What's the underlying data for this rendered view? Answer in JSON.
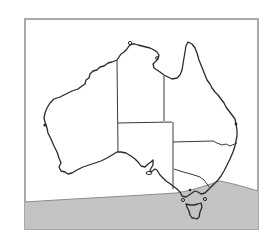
{
  "map": {
    "subject": "Australia",
    "style": "outline map with state borders",
    "frame": {
      "x": 25,
      "y": 19,
      "width": 233,
      "height": 210,
      "border_color": "#a8a8a8"
    },
    "colors": {
      "land_fill": "#ffffff",
      "coastline": "#2a2a2a",
      "state_border": "#3a3a3a",
      "shaded_region": "#b9b9b9",
      "shaded_region_border": "#8c8c8c",
      "background": "#ffffff"
    },
    "regions": [
      {
        "id": "western-australia"
      },
      {
        "id": "northern-territory"
      },
      {
        "id": "south-australia"
      },
      {
        "id": "queensland"
      },
      {
        "id": "new-south-wales"
      },
      {
        "id": "victoria"
      },
      {
        "id": "tasmania"
      }
    ],
    "shaded_area": {
      "description": "stippled band across the southern edge of the map covering the ocean south of the mainland, Victoria's coast and Tasmania"
    }
  }
}
